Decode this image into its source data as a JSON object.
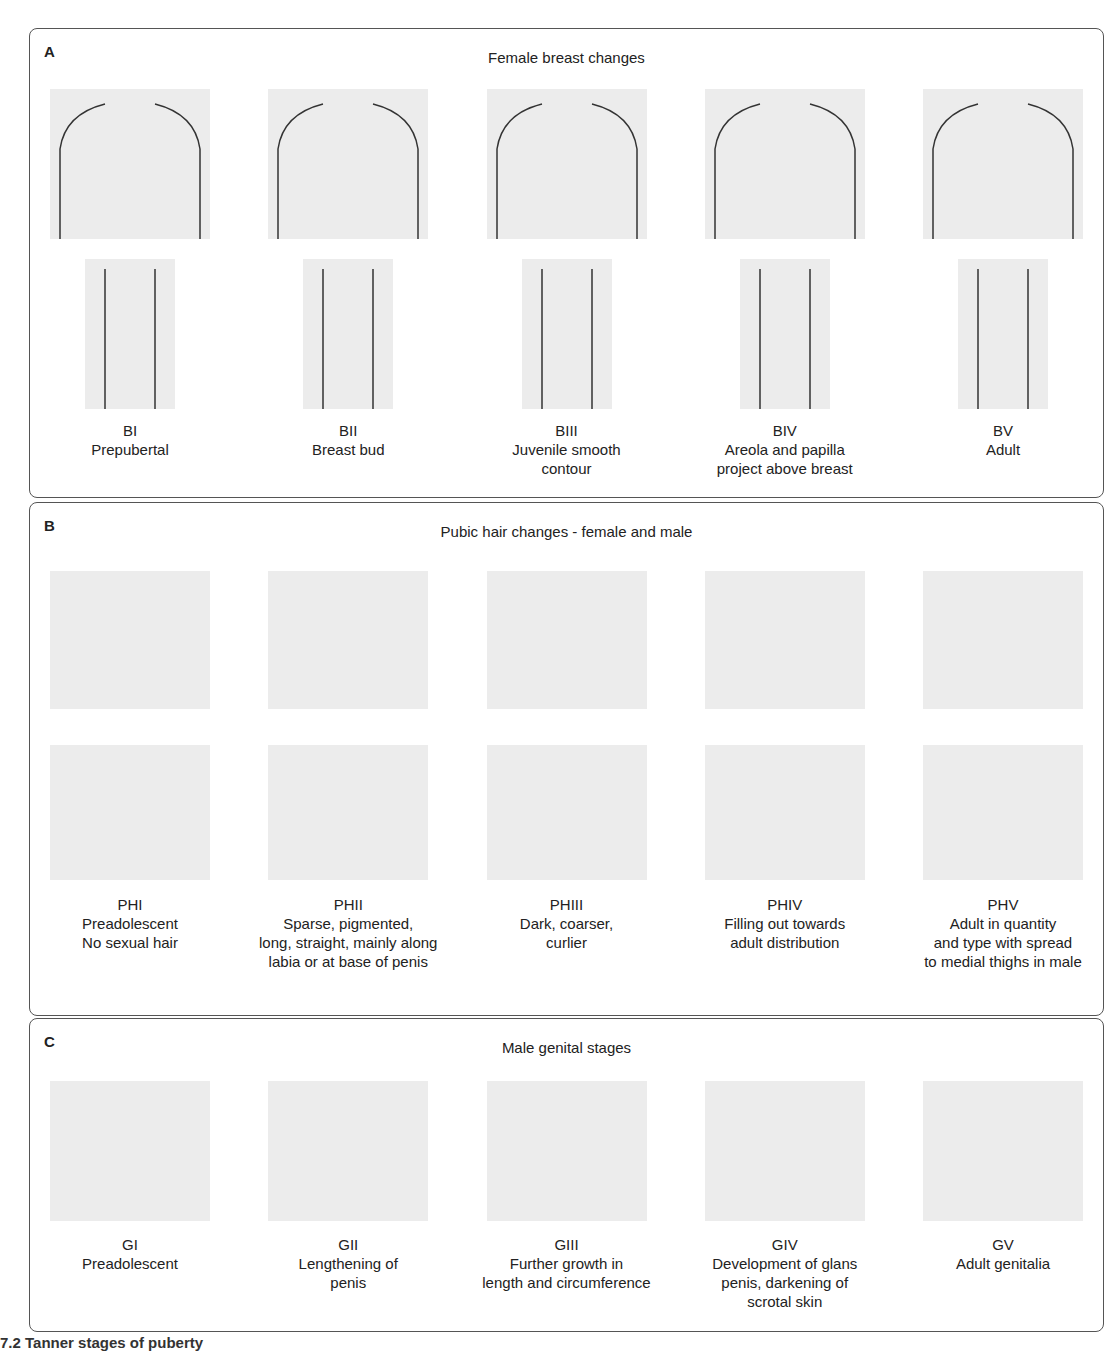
{
  "figure": {
    "caption_fragment": "7.2 Tanner stages of puberty"
  },
  "panels": [
    {
      "letter": "A",
      "title": "Female breast changes",
      "stages": [
        {
          "code": "BI",
          "description": "Prepubertal"
        },
        {
          "code": "BII",
          "description": "Breast bud"
        },
        {
          "code": "BIII",
          "description": "Juvenile smooth\ncontour"
        },
        {
          "code": "BIV",
          "description": "Areola and papilla\nproject above breast"
        },
        {
          "code": "BV",
          "description": "Adult"
        }
      ]
    },
    {
      "letter": "B",
      "title": "Pubic hair changes - female and male",
      "stages": [
        {
          "code": "PHI",
          "description": "Preadolescent\nNo sexual hair"
        },
        {
          "code": "PHII",
          "description": "Sparse, pigmented,\nlong, straight, mainly along\nlabia or at base of penis"
        },
        {
          "code": "PHIII",
          "description": "Dark, coarser,\ncurlier"
        },
        {
          "code": "PHIV",
          "description": "Filling out towards\nadult distribution"
        },
        {
          "code": "PHV",
          "description": "Adult in quantity\nand type with spread\nto medial thighs in male"
        }
      ]
    },
    {
      "letter": "C",
      "title": "Male genital stages",
      "stages": [
        {
          "code": "GI",
          "description": "Preadolescent"
        },
        {
          "code": "GII",
          "description": "Lengthening of\npenis"
        },
        {
          "code": "GIII",
          "description": "Further growth in\nlength and circumference"
        },
        {
          "code": "GIV",
          "description": "Development of glans\npenis, darkening of\nscrotal skin"
        },
        {
          "code": "GV",
          "description": "Adult genitalia"
        }
      ]
    }
  ]
}
